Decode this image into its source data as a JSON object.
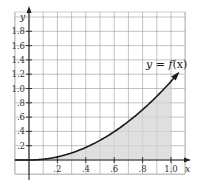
{
  "chart_data": {
    "type": "area",
    "title": "",
    "xlabel": "x",
    "ylabel": "y",
    "xlim": [
      -0.1,
      1.1
    ],
    "ylim": [
      -0.1,
      2.0
    ],
    "grid": true,
    "x_ticks": [
      0.2,
      0.4,
      0.6,
      0.8,
      1.0
    ],
    "x_tick_labels": [
      ".2",
      ".4",
      ".6",
      ".8",
      "1.0"
    ],
    "y_ticks": [
      0.2,
      0.4,
      0.6,
      0.8,
      1.0,
      1.2,
      1.4,
      1.6,
      1.8
    ],
    "y_tick_labels": [
      ".2",
      ".4",
      ".6",
      ".8",
      "1.0",
      "1.2",
      "1.4",
      "1.6",
      "1.8"
    ],
    "series": [
      {
        "name": "y = f(x)",
        "x": [
          -0.1,
          0,
          0.1,
          0.2,
          0.3,
          0.4,
          0.5,
          0.6,
          0.7,
          0.8,
          0.9,
          1.0,
          1.05
        ],
        "y": [
          0,
          0,
          0.011,
          0.044,
          0.099,
          0.176,
          0.275,
          0.396,
          0.539,
          0.704,
          0.891,
          1.1,
          1.21
        ]
      }
    ],
    "shaded_region": {
      "from_x": 0,
      "to_x": 1.0,
      "under": "y = f(x)"
    },
    "annotations": [
      {
        "text": "y = f(x)",
        "x": 0.88,
        "y": 1.28
      }
    ],
    "colors": {
      "curve": "#1a1a1a",
      "shade": "#d4d4d4",
      "grid": "#9a9a9a",
      "axis": "#222222"
    }
  },
  "labels": {
    "x_axis": "x",
    "y_axis": "y",
    "function_lhs": "y = ",
    "function_name": "f",
    "function_arg": "(x)"
  }
}
